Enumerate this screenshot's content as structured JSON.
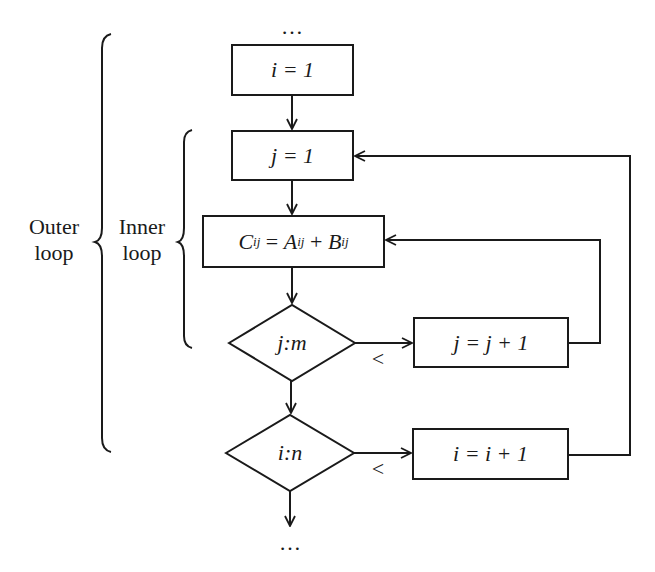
{
  "diagram": {
    "type": "flowchart",
    "start_ellipsis": "…",
    "end_ellipsis": "…",
    "braces": {
      "outer": {
        "label_line1": "Outer",
        "label_line2": "loop"
      },
      "inner": {
        "label_line1": "Inner",
        "label_line2": "loop"
      }
    },
    "nodes": {
      "init_i": {
        "shape": "rect",
        "text": "i = 1"
      },
      "init_j": {
        "shape": "rect",
        "text": "j = 1"
      },
      "compute": {
        "shape": "rect",
        "text": "C_ij = A_ij + B_ij",
        "parts": {
          "c": "C",
          "a": "A",
          "b": "B",
          "sub": "ij",
          "eq": "=",
          "plus": "+"
        }
      },
      "test_j": {
        "shape": "diamond",
        "text": "j:m"
      },
      "inc_j": {
        "shape": "rect",
        "text": "j = j + 1"
      },
      "test_i": {
        "shape": "diamond",
        "text": "i:n"
      },
      "inc_i": {
        "shape": "rect",
        "text": "i = i + 1"
      }
    },
    "edges": [
      {
        "from": "start",
        "to": "init_i"
      },
      {
        "from": "init_i",
        "to": "init_j"
      },
      {
        "from": "init_j",
        "to": "compute"
      },
      {
        "from": "compute",
        "to": "test_j"
      },
      {
        "from": "test_j",
        "to": "inc_j",
        "label": "<"
      },
      {
        "from": "inc_j",
        "to": "compute"
      },
      {
        "from": "test_j",
        "to": "test_i"
      },
      {
        "from": "test_i",
        "to": "inc_i",
        "label": "<"
      },
      {
        "from": "inc_i",
        "to": "init_j"
      },
      {
        "from": "test_i",
        "to": "end"
      }
    ],
    "edge_labels": {
      "test_j_less": "<",
      "test_i_less": "<"
    },
    "colors": {
      "stroke": "#1a1a1a",
      "background": "#ffffff"
    }
  }
}
